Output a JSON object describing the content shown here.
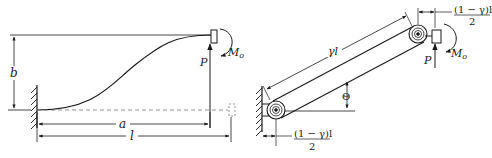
{
  "figure": {
    "left_panel": {
      "description": "Deflected cantilever beam with end load",
      "labels": {
        "b": "b",
        "a": "a",
        "l": "l",
        "P": "P",
        "M": "M",
        "M_sub": "o"
      }
    },
    "right_panel": {
      "description": "Pseudo-rigid-body model with torsional springs",
      "labels": {
        "gamma_l": "γl",
        "theta": "Θ",
        "P": "P",
        "M": "M",
        "M_sub": "o",
        "frac_top_num": "(1 − γ)l",
        "frac_top_den": "2",
        "frac_bottom_num": "(1 − γ)l",
        "frac_bottom_den": "2"
      }
    },
    "colors": {
      "line": "#1a1a1a",
      "dashed": "#777777",
      "background": "#ffffff"
    }
  }
}
